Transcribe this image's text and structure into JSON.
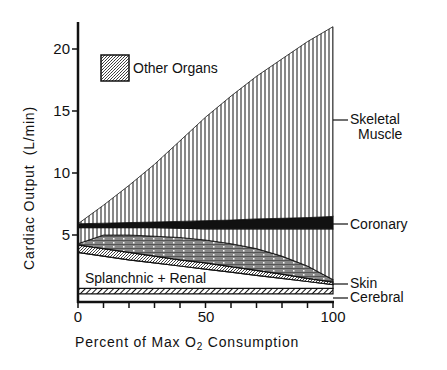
{
  "chart_data": {
    "type": "area",
    "title": "",
    "xlabel": "Percent of Max O₂ Consumption",
    "ylabel": "Cardiac Output  (L/min)",
    "xlim": [
      0,
      100
    ],
    "ylim": [
      0,
      22
    ],
    "x_ticks": [
      0,
      50,
      100
    ],
    "x_minor_ticks": [
      0,
      10,
      20,
      30,
      40,
      50,
      60,
      70,
      80,
      90,
      100
    ],
    "y_ticks": [
      5,
      10,
      15,
      20
    ],
    "grid": false,
    "legend": {
      "position": "upper-left",
      "entries": [
        "Other Organs"
      ]
    },
    "x": [
      0,
      10,
      20,
      30,
      40,
      50,
      60,
      70,
      80,
      90,
      100
    ],
    "series": [
      {
        "name": "Cerebral",
        "lower": [
          0.25,
          0.25,
          0.25,
          0.25,
          0.25,
          0.25,
          0.25,
          0.25,
          0.25,
          0.25,
          0.25
        ],
        "upper": [
          0.7,
          0.7,
          0.7,
          0.7,
          0.7,
          0.7,
          0.7,
          0.7,
          0.7,
          0.7,
          0.7
        ],
        "pattern": "diagonal-hatch"
      },
      {
        "name": "Splanchnic + Renal",
        "lower": [
          0.7,
          0.7,
          0.7,
          0.7,
          0.7,
          0.7,
          0.7,
          0.7,
          0.7,
          0.7,
          0.7
        ],
        "upper": [
          3.6,
          3.3,
          3.0,
          2.75,
          2.5,
          2.25,
          2.0,
          1.75,
          1.5,
          1.25,
          1.0
        ],
        "pattern": "white"
      },
      {
        "name": "Skin",
        "lower": [
          3.6,
          3.3,
          3.0,
          2.75,
          2.5,
          2.25,
          2.0,
          1.75,
          1.5,
          1.25,
          1.0
        ],
        "upper": [
          4.2,
          3.9,
          3.6,
          3.3,
          3.0,
          2.75,
          2.45,
          2.15,
          1.85,
          1.5,
          1.2
        ],
        "pattern": "fine-stipple"
      },
      {
        "name": "Other Organs",
        "lower": [
          4.2,
          3.9,
          3.6,
          3.3,
          3.0,
          2.75,
          2.45,
          2.15,
          1.85,
          1.5,
          1.2
        ],
        "upper": [
          4.3,
          5.0,
          5.0,
          4.9,
          4.8,
          4.6,
          4.3,
          3.9,
          3.3,
          2.5,
          1.4
        ],
        "pattern": "dotted-horizontal"
      },
      {
        "name": "Skeletal Muscle (lower part)",
        "lower": [
          4.3,
          5.0,
          5.0,
          4.9,
          4.8,
          4.6,
          4.3,
          3.9,
          3.3,
          2.5,
          1.4
        ],
        "upper": [
          5.6,
          5.6,
          5.6,
          5.6,
          5.55,
          5.5,
          5.5,
          5.5,
          5.5,
          5.5,
          5.5
        ],
        "pattern": "vertical-lines"
      },
      {
        "name": "Coronary",
        "lower": [
          5.6,
          5.6,
          5.6,
          5.6,
          5.55,
          5.5,
          5.5,
          5.5,
          5.5,
          5.5,
          5.5
        ],
        "upper": [
          5.9,
          5.95,
          6.0,
          6.05,
          6.1,
          6.15,
          6.2,
          6.3,
          6.35,
          6.4,
          6.5
        ],
        "pattern": "solid-black"
      },
      {
        "name": "Skeletal Muscle",
        "lower": [
          5.9,
          5.95,
          6.0,
          6.05,
          6.1,
          6.15,
          6.2,
          6.3,
          6.35,
          6.4,
          6.5
        ],
        "upper": [
          5.9,
          7.4,
          9.0,
          10.7,
          12.6,
          14.5,
          16.2,
          17.8,
          19.2,
          20.6,
          21.8
        ],
        "pattern": "vertical-lines"
      }
    ],
    "annotations": [
      "Skeletal Muscle",
      "Coronary",
      "Skin",
      "Cerebral",
      "Splanchnic + Renal",
      "Other Organs"
    ]
  },
  "labels": {
    "y_axis": "Cardiac Output  (L/min)",
    "x_axis_prefix": "Percent of Max O",
    "x_axis_sub": "2",
    "x_axis_suffix": " Consumption",
    "legend_other": "Other Organs",
    "skeletal_1": "Skeletal",
    "skeletal_2": "Muscle",
    "coronary": "Coronary",
    "skin": "Skin",
    "cerebral": "Cerebral",
    "splanchnic": "Splanchnic + Renal",
    "xt0": "0",
    "xt50": "50",
    "xt100": "100",
    "yt5": "5",
    "yt10": "10",
    "yt15": "15",
    "yt20": "20"
  }
}
